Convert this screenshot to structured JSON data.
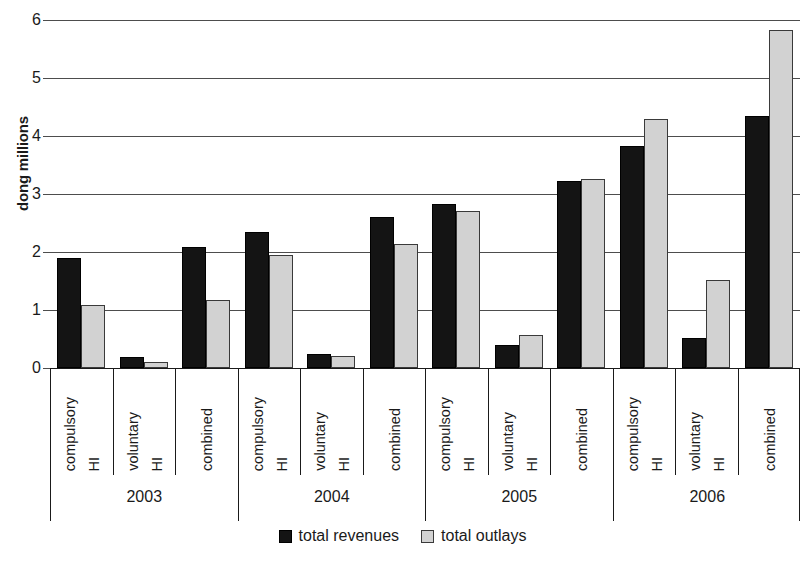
{
  "chart_data": {
    "type": "bar",
    "title": "",
    "subtitle": "",
    "xlabel": "",
    "ylabel": "dong millions",
    "ylim": [
      0,
      6
    ],
    "yticks": [
      0,
      1,
      2,
      3,
      4,
      5,
      6
    ],
    "ytick_labels": [
      "0",
      "1",
      "2",
      "3",
      "4",
      "5",
      "6"
    ],
    "grid": true,
    "legend_position": "bottom",
    "group_labels": [
      "2003",
      "2004",
      "2005",
      "2006"
    ],
    "categories": [
      "compulsory HI",
      "voluntary HI",
      "combined",
      "compulsory HI",
      "voluntary HI",
      "combined",
      "compulsory HI",
      "voluntary HI",
      "combined",
      "compulsory HI",
      "voluntary HI",
      "combined"
    ],
    "series": [
      {
        "name": "total revenues",
        "color": "#141414",
        "values": [
          1.9,
          0.19,
          2.09,
          2.34,
          0.25,
          2.6,
          2.83,
          0.4,
          3.23,
          3.83,
          0.52,
          4.35
        ]
      },
      {
        "name": "total outlays",
        "color": "#d2d2d2",
        "values": [
          1.09,
          0.1,
          1.18,
          1.94,
          0.2,
          2.14,
          2.7,
          0.57,
          3.26,
          4.3,
          1.52,
          5.82
        ]
      }
    ]
  },
  "axis": {
    "y_title": "dong millions",
    "y_tick_labels": [
      "6",
      "5",
      "4",
      "3",
      "2",
      "1",
      "0"
    ]
  },
  "groups": [
    {
      "year": "2003",
      "categories": [
        {
          "line1": "compulsory",
          "line2": "HI",
          "full": "compulsory HI"
        },
        {
          "line1": "voluntary",
          "line2": "HI",
          "full": "voluntary HI"
        },
        {
          "line1": "combined",
          "line2": "",
          "full": "combined"
        }
      ]
    },
    {
      "year": "2004",
      "categories": [
        {
          "line1": "compulsory",
          "line2": "HI",
          "full": "compulsory HI"
        },
        {
          "line1": "voluntary",
          "line2": "HI",
          "full": "voluntary HI"
        },
        {
          "line1": "combined",
          "line2": "",
          "full": "combined"
        }
      ]
    },
    {
      "year": "2005",
      "categories": [
        {
          "line1": "compulsory",
          "line2": "HI",
          "full": "compulsory HI"
        },
        {
          "line1": "voluntary",
          "line2": "HI",
          "full": "voluntary HI"
        },
        {
          "line1": "combined",
          "line2": "",
          "full": "combined"
        }
      ]
    },
    {
      "year": "2006",
      "categories": [
        {
          "line1": "compulsory",
          "line2": "HI",
          "full": "compulsory HI"
        },
        {
          "line1": "voluntary",
          "line2": "HI",
          "full": "voluntary HI"
        },
        {
          "line1": "combined",
          "line2": "",
          "full": "combined"
        }
      ]
    }
  ],
  "legend": {
    "items": [
      {
        "label": "total revenues",
        "color": "#141414"
      },
      {
        "label": "total outlays",
        "color": "#d2d2d2"
      }
    ]
  }
}
